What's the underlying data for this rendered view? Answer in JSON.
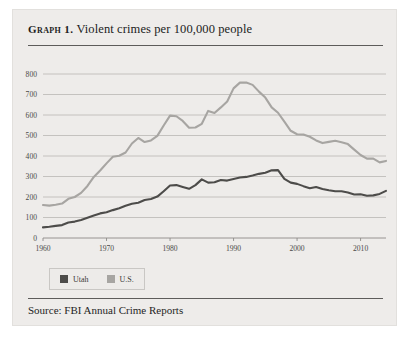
{
  "figure": {
    "label": "Graph 1.",
    "title": "Violent crimes per 100,000 people",
    "source": "Source: FBI Annual Crime Reports",
    "card_bg": "#eeecea",
    "rule_color": "#5d5c5a"
  },
  "legend": {
    "position": "bottom-left",
    "items": [
      {
        "label": "Utah",
        "color": "#4d4c4a"
      },
      {
        "label": "U.S.",
        "color": "#a7a5a2"
      }
    ]
  },
  "chart_data": {
    "type": "line",
    "title": "Violent crimes per 100,000 people",
    "xlabel": "",
    "ylabel": "",
    "xlim": [
      1960,
      2014
    ],
    "ylim": [
      0,
      800
    ],
    "ytick_step": 100,
    "yticks": [
      0,
      100,
      200,
      300,
      400,
      500,
      600,
      700,
      800
    ],
    "xticks": [
      1960,
      1970,
      1980,
      1990,
      2000,
      2010
    ],
    "xtick_labels": [
      "1960",
      "1970",
      "1980",
      "1990",
      "2000",
      "2010"
    ],
    "grid": "horizontal",
    "x": [
      1960,
      1961,
      1962,
      1963,
      1964,
      1965,
      1966,
      1967,
      1968,
      1969,
      1970,
      1971,
      1972,
      1973,
      1974,
      1975,
      1976,
      1977,
      1978,
      1979,
      1980,
      1981,
      1982,
      1983,
      1984,
      1985,
      1986,
      1987,
      1988,
      1989,
      1990,
      1991,
      1992,
      1993,
      1994,
      1995,
      1996,
      1997,
      1998,
      1999,
      2000,
      2001,
      2002,
      2003,
      2004,
      2005,
      2006,
      2007,
      2008,
      2009,
      2010,
      2011,
      2012,
      2013,
      2014
    ],
    "series": [
      {
        "name": "U.S.",
        "color": "#a7a5a2",
        "width": 2.1,
        "values": [
          161,
          158,
          162,
          168,
          191,
          200,
          220,
          254,
          298,
          329,
          364,
          396,
          401,
          417,
          461,
          488,
          468,
          476,
          498,
          549,
          597,
          594,
          571,
          538,
          539,
          557,
          620,
          610,
          637,
          666,
          730,
          758,
          758,
          747,
          714,
          685,
          637,
          611,
          568,
          523,
          506,
          505,
          494,
          476,
          463,
          469,
          474,
          467,
          458,
          431,
          405,
          387,
          387,
          369,
          376
        ]
      },
      {
        "name": "Utah",
        "color": "#4d4c4a",
        "width": 2.1,
        "values": [
          52,
          55,
          59,
          63,
          76,
          80,
          88,
          99,
          110,
          120,
          126,
          136,
          145,
          157,
          167,
          172,
          185,
          190,
          202,
          228,
          256,
          258,
          249,
          240,
          258,
          286,
          270,
          272,
          283,
          280,
          288,
          295,
          298,
          305,
          313,
          318,
          330,
          331,
          288,
          270,
          264,
          253,
          243,
          249,
          239,
          233,
          228,
          228,
          222,
          212,
          213,
          206,
          208,
          215,
          230
        ]
      }
    ]
  }
}
